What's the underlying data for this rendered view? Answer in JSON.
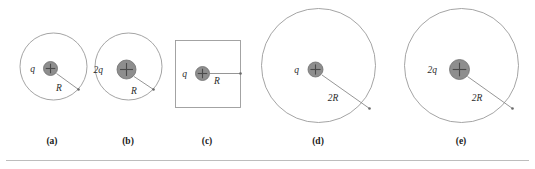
{
  "figure": {
    "kind": "physics-diagram",
    "topic": "gaussian-surfaces-point-charges",
    "background_color": "#ffffff",
    "boundary_stroke_color": "#9a9a9a",
    "charge_fill_color": "#8e8e8e",
    "charge_stroke_color": "#6f6f6f",
    "plus_sign_color": "#4a4a4a",
    "radius_line_color": "#8a8a8a",
    "label_text_color": "#2b2b2b",
    "caption_text_color": "#1a1a1a",
    "rule_color": "#b5b5b5"
  },
  "panels": [
    {
      "id": "a",
      "caption": "(a)",
      "caption_x": 52,
      "caption_y": 144,
      "surface_shape": "circle",
      "surface_cx": 53.5,
      "surface_cy": 66.5,
      "surface_r": 33.5,
      "charge_label": "q",
      "charge_label_x": 35,
      "charge_label_y": 72,
      "charge_cx": 50.5,
      "charge_cy": 68.5,
      "charge_r": 7.0,
      "radius_label": "R",
      "radius_label_x": 59,
      "radius_label_y": 91,
      "radius_from_x": 56.5,
      "radius_from_y": 73.5,
      "radius_to_x": 78.5,
      "radius_to_y": 89.5
    },
    {
      "id": "b",
      "caption": "(b)",
      "caption_x": 128,
      "caption_y": 144,
      "surface_shape": "circle",
      "surface_cx": 128.5,
      "surface_cy": 66.5,
      "surface_r": 33.5,
      "charge_label": "2q",
      "charge_label_x": 103,
      "charge_label_y": 73,
      "charge_cx": 126.5,
      "charge_cy": 69.5,
      "charge_r": 9.5,
      "radius_label": "R",
      "radius_label_x": 134,
      "radius_label_y": 94,
      "radius_from_x": 134.0,
      "radius_from_y": 76.5,
      "radius_to_x": 153.5,
      "radius_to_y": 89.5
    },
    {
      "id": "c",
      "caption": "(c)",
      "caption_x": 207,
      "caption_y": 144,
      "surface_shape": "square",
      "square_x": 175.5,
      "square_y": 40.5,
      "square_w": 65,
      "square_h": 67,
      "charge_label": "q",
      "charge_label_x": 187,
      "charge_label_y": 77,
      "charge_cx": 202.5,
      "charge_cy": 73.5,
      "charge_r": 7.0,
      "radius_label": "R",
      "radius_label_x": 217,
      "radius_label_y": 84,
      "radius_from_x": 209.5,
      "radius_from_y": 73.5,
      "radius_to_x": 240.5,
      "radius_to_y": 73.5
    },
    {
      "id": "d",
      "caption": "(d)",
      "caption_x": 318,
      "caption_y": 144,
      "surface_shape": "circle",
      "surface_cx": 318.5,
      "surface_cy": 65.5,
      "surface_r": 57.0,
      "charge_label": "q",
      "charge_label_x": 299,
      "charge_label_y": 73,
      "charge_cx": 315.5,
      "charge_cy": 69.5,
      "charge_r": 7.5,
      "radius_label": "2R",
      "radius_label_x": 333,
      "radius_label_y": 101,
      "radius_from_x": 322.0,
      "radius_from_y": 75.0,
      "radius_to_x": 369.5,
      "radius_to_y": 108.5
    },
    {
      "id": "e",
      "caption": "(e)",
      "caption_x": 461,
      "caption_y": 144,
      "surface_shape": "circle",
      "surface_cx": 461.5,
      "surface_cy": 65.5,
      "surface_r": 57.0,
      "charge_label": "2q",
      "charge_label_x": 437,
      "charge_label_y": 73,
      "charge_cx": 459.5,
      "charge_cy": 69.5,
      "charge_r": 10.0,
      "radius_label": "2R",
      "radius_label_x": 477,
      "radius_label_y": 101,
      "radius_from_x": 467.5,
      "radius_from_y": 76.5,
      "radius_to_x": 512.5,
      "radius_to_y": 108.5
    }
  ],
  "footer_rule": {
    "x1": 6,
    "y1": 160.5,
    "x2": 529,
    "y2": 160.5
  }
}
